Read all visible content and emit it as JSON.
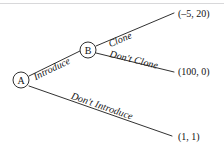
{
  "diagram": {
    "type": "game-tree",
    "background_color": "#ffffff",
    "line_color": "#1a1a1a",
    "text_color": "#141414"
  },
  "nodes": [
    {
      "id": "A",
      "label": "A",
      "x": 21,
      "y": 80,
      "r": 8
    },
    {
      "id": "B",
      "label": "B",
      "x": 88,
      "y": 50,
      "r": 8
    }
  ],
  "edges": [
    {
      "id": "introduce",
      "label": "Introduce",
      "from": "A",
      "to": "B",
      "x1": 29,
      "y1": 76,
      "x2": 80,
      "y2": 51,
      "label_x": 32,
      "label_y": 73,
      "label_angle": -26
    },
    {
      "id": "clone",
      "label": "Clone",
      "from": "B",
      "to": "payoff-clone",
      "x1": 96,
      "y1": 46,
      "x2": 174,
      "y2": 13,
      "label_x": 107,
      "label_y": 40,
      "label_angle": -23
    },
    {
      "id": "dont-clone",
      "label": "Don't Clone",
      "from": "B",
      "to": "payoff-dont-clone",
      "x1": 96,
      "y1": 53,
      "x2": 174,
      "y2": 72,
      "label_x": 111,
      "label_y": 49,
      "label_angle": 14
    },
    {
      "id": "dont-introduce",
      "label": "Don't Introduce",
      "from": "A",
      "to": "payoff-dont-introduce",
      "x1": 29,
      "y1": 86,
      "x2": 172,
      "y2": 136,
      "label_x": 73,
      "label_y": 91,
      "label_angle": 19
    }
  ],
  "payoffs": [
    {
      "id": "payoff-clone",
      "label": "(–5, 20)",
      "x": 178,
      "y": 9
    },
    {
      "id": "payoff-dont-clone",
      "label": "(100, 0)",
      "x": 178,
      "y": 67
    },
    {
      "id": "payoff-dont-introduce",
      "label": "(1, 1)",
      "x": 178,
      "y": 132
    }
  ]
}
